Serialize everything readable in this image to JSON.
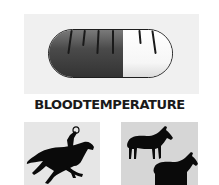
{
  "title": "BLOODTEMPERATURE",
  "gauge": {
    "type": "pill-thermometer",
    "fill_percent": 60,
    "tick_count": 6,
    "fill_color": "#4a4a4a",
    "empty_color": "#ffffff"
  },
  "panels": [
    {
      "name": "galloping-horse-with-rider",
      "background": "#e6e6e6"
    },
    {
      "name": "two-standing-horses",
      "background": "#d6d6d6"
    }
  ]
}
